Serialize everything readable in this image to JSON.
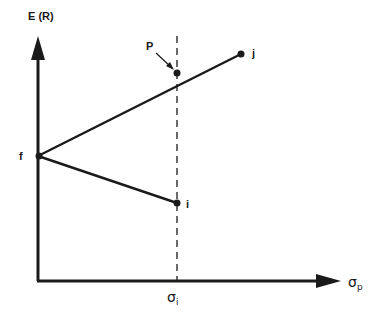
{
  "diagram": {
    "y_axis_label": "E (R)",
    "x_axis_label": {
      "symbol": "σ",
      "subscript": "p"
    },
    "x_tick_label": {
      "symbol": "σ",
      "subscript": "i"
    },
    "points": [
      {
        "name": "f",
        "label": "f"
      },
      {
        "name": "P",
        "label": "P"
      },
      {
        "name": "j",
        "label": "j"
      },
      {
        "name": "i",
        "label": "i"
      }
    ],
    "lines": [
      {
        "from": "f",
        "to": "j",
        "through": "P"
      },
      {
        "from": "f",
        "to": "i"
      }
    ],
    "dashed_vertical_at": "σi",
    "colors": {
      "ink": "#1a1a1a",
      "background": "#ffffff"
    }
  }
}
